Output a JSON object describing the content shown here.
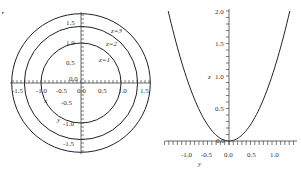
{
  "chart_data": [
    {
      "type": "line",
      "title": "",
      "subtitle": "Level curves x^2 + y^2 = z",
      "xlabel": "x",
      "ylabel": "y",
      "xlim": [
        -1.7,
        1.7
      ],
      "ylim": [
        -1.7,
        1.7
      ],
      "x_ticks": [
        "-1.5",
        "-1.0",
        "-0.5",
        "0.0",
        "0.5",
        "1.0",
        "1.5"
      ],
      "y_ticks": [
        "1.5",
        "1.0",
        "0.5",
        "0.0",
        "-0.5",
        "-1.0",
        "-1.5"
      ],
      "series": [
        {
          "name": "z=1",
          "shape": "circle",
          "radius": 1.0
        },
        {
          "name": "z=2",
          "shape": "circle",
          "radius": 1.414
        },
        {
          "name": "z=3",
          "shape": "circle",
          "radius": 1.732
        }
      ],
      "annotations": [
        "z=1",
        "z=2",
        "z=3"
      ],
      "grid": false
    },
    {
      "type": "line",
      "title": "",
      "subtitle": "Trace z = y^2",
      "xlabel": "y",
      "ylabel": "z",
      "xlim": [
        -1.45,
        1.45
      ],
      "ylim": [
        0,
        2.0
      ],
      "x_ticks": [
        "-1.0",
        "-0.5",
        "0.0",
        "0.5",
        "1.0"
      ],
      "y_ticks": [
        "2.0",
        "1.5",
        "1.0",
        "0.5",
        "0.0"
      ],
      "series": [
        {
          "name": "z = y^2",
          "x": [
            -1.414,
            -1.0,
            -0.5,
            0.0,
            0.5,
            1.0,
            1.414
          ],
          "y": [
            2.0,
            1.0,
            0.25,
            0.0,
            0.25,
            1.0,
            2.0
          ]
        }
      ],
      "grid": false
    }
  ],
  "left": {
    "xlabel": "x",
    "ylabel": "y",
    "origin": "0.0",
    "xticks": [
      "-1.5",
      "-1.0",
      "-0.5",
      "0.0",
      "0.5",
      "1.0",
      "1.5"
    ],
    "yticks": [
      "1.5",
      "1.0",
      "0.5",
      "-0.5",
      "-1.0",
      "-1.5"
    ],
    "curve_labels": [
      "z=1",
      "z=2",
      "z=3"
    ]
  },
  "right": {
    "xlabel": "y",
    "ylabel": "z",
    "origin": "0.0",
    "xticks": [
      "-1.0",
      "-0.5",
      "0.0",
      "0.5",
      "1.0"
    ],
    "yticks": [
      "2.0",
      "1.5",
      "1.0",
      "0.5"
    ]
  },
  "colors": {
    "curve": "#222222",
    "axis": "#444444",
    "text": "#333333"
  }
}
